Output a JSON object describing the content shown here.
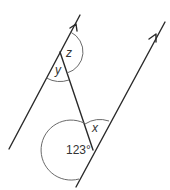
{
  "diagram": {
    "type": "parallel-lines-with-transversal",
    "colors": {
      "line": "#2a2a2a",
      "arc": "#6a6a6a",
      "text": "#333333",
      "background": "#ffffff"
    },
    "lines": [
      {
        "id": "left-parallel",
        "from": [
          9,
          149
        ],
        "to": [
          80,
          15
        ],
        "arrow": true
      },
      {
        "id": "right-parallel",
        "from": [
          76,
          187
        ],
        "to": [
          165,
          22
        ],
        "arrow": true
      },
      {
        "id": "transversal",
        "from": [
          60,
          52
        ],
        "to": [
          93,
          150
        ],
        "arrow": false
      }
    ],
    "angles": [
      {
        "id": "z",
        "label": "z"
      },
      {
        "id": "y",
        "label": "y"
      },
      {
        "id": "x",
        "label": "x"
      },
      {
        "id": "given",
        "label": "123°"
      }
    ]
  }
}
